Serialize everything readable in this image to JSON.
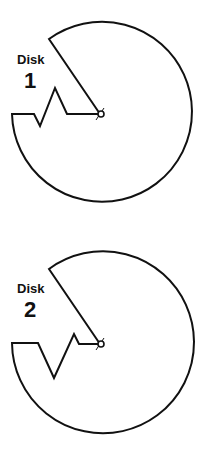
{
  "figure": {
    "background": "#ffffff",
    "stroke_color": "#111111",
    "disks": [
      {
        "label_word": "Disk",
        "label_number": "1",
        "notch_shape": "small zigzag near center, deep spike upward"
      },
      {
        "label_word": "Disk",
        "label_number": "2",
        "notch_shape": "deep V downward, small zigzag near center"
      }
    ]
  }
}
